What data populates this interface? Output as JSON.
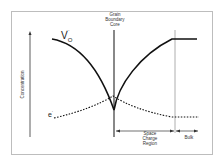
{
  "diagram": {
    "type": "space-charge-concentration-profile",
    "labels": {
      "grain_boundary": "Grain\nBoundary\nCore",
      "grain_boundary_lines": [
        "Grain",
        "Boundary",
        "Core"
      ],
      "y_axis": "Concentration",
      "vacancy_species": "V",
      "vacancy_sub": "O",
      "vacancy_sup": "··",
      "electron_species": "e",
      "electron_sup": "'",
      "space_charge_lines": [
        "Space",
        "Charge",
        "Region"
      ],
      "bulk": "Bulk"
    },
    "colors": {
      "curve": "#111111",
      "frame": "#bdbdbd",
      "boundary_line": "#888888",
      "text": "#333333"
    },
    "curves": [
      {
        "name": "oxygen-vacancy",
        "style": "solid",
        "shape": "decreases toward boundary core, rises to bulk plateau"
      },
      {
        "name": "electron",
        "style": "dotted",
        "shape": "increases toward boundary core, decays to bulk plateau"
      }
    ]
  }
}
